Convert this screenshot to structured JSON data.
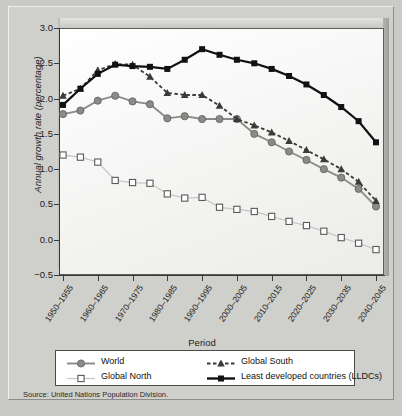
{
  "figure": {
    "source_note": "Source: United Nations Population Division.",
    "background_color": "#cfcfcc",
    "plot_background_color": "#fbfbfb"
  },
  "axes": {
    "ylabel_text": "Annual growth rate ",
    "ylabel_italic": "(percentage)",
    "xlabel": "Period",
    "yticks": [
      "3.0",
      "2.5",
      "2.0",
      "1.5",
      "1.0",
      "0.5",
      "0.0",
      "−0.5"
    ],
    "xticks": [
      "1950–1955",
      "1960–1965",
      "1970–1975",
      "1980–1985",
      "1990–1995",
      "2000–2005",
      "2010–2015",
      "2020–2025",
      "2030–2035",
      "2040–2045"
    ]
  },
  "legend": {
    "items": [
      {
        "label": "World",
        "color": "#8a8a88",
        "marker": "circle",
        "dash": "solid"
      },
      {
        "label": "Global North",
        "color": "#c8c8c6",
        "marker": "square-open",
        "dash": "solid"
      },
      {
        "label": "Global South",
        "color": "#3a3a38",
        "marker": "triangle",
        "dash": "dashed"
      },
      {
        "label": "Least developed countries (LLDCs)",
        "color": "#111111",
        "marker": "square",
        "dash": "solid"
      }
    ]
  },
  "chart_data": {
    "type": "line",
    "title": "",
    "xlabel": "Period",
    "ylabel": "Annual growth rate (percentage)",
    "ylim": [
      -0.5,
      3.0
    ],
    "ytick_values": [
      3.0,
      2.5,
      2.0,
      1.5,
      1.0,
      0.5,
      0.0,
      -0.5
    ],
    "grid": false,
    "legend_position": "bottom",
    "categories": [
      "1950-1955",
      "1955-1960",
      "1960-1965",
      "1965-1970",
      "1970-1975",
      "1975-1980",
      "1980-1985",
      "1985-1990",
      "1990-1995",
      "1995-2000",
      "2000-2005",
      "2005-2010",
      "2010-2015",
      "2015-2020",
      "2020-2025",
      "2025-2030",
      "2030-2035",
      "2035-2040",
      "2040-2045"
    ],
    "series": [
      {
        "name": "World",
        "color": "#8a8a88",
        "marker": "circle",
        "dash": "solid",
        "values": [
          1.78,
          1.83,
          1.97,
          2.04,
          1.96,
          1.92,
          1.72,
          1.75,
          1.71,
          1.71,
          1.71,
          1.5,
          1.38,
          1.25,
          1.13,
          1.0,
          0.88,
          0.72,
          0.47
        ]
      },
      {
        "name": "Global North",
        "color": "#c8c8c6",
        "marker": "square-open",
        "dash": "solid",
        "values": [
          1.2,
          1.17,
          1.1,
          0.84,
          0.81,
          0.8,
          0.65,
          0.59,
          0.6,
          0.46,
          0.43,
          0.4,
          0.33,
          0.26,
          0.2,
          0.12,
          0.03,
          -0.05,
          -0.14
        ]
      },
      {
        "name": "Global South",
        "color": "#3a3a38",
        "marker": "triangle",
        "dash": "dashed",
        "values": [
          2.04,
          2.14,
          2.4,
          2.49,
          2.48,
          2.31,
          2.08,
          2.05,
          2.05,
          1.9,
          1.71,
          1.62,
          1.52,
          1.4,
          1.27,
          1.14,
          1.0,
          0.82,
          0.55
        ]
      },
      {
        "name": "Least developed countries (LLDCs)",
        "color": "#111111",
        "marker": "square",
        "dash": "solid",
        "values": [
          1.91,
          2.14,
          2.35,
          2.48,
          2.46,
          2.45,
          2.42,
          2.55,
          2.7,
          2.62,
          2.55,
          2.5,
          2.42,
          2.32,
          2.2,
          2.05,
          1.88,
          1.68,
          1.38
        ]
      }
    ]
  }
}
